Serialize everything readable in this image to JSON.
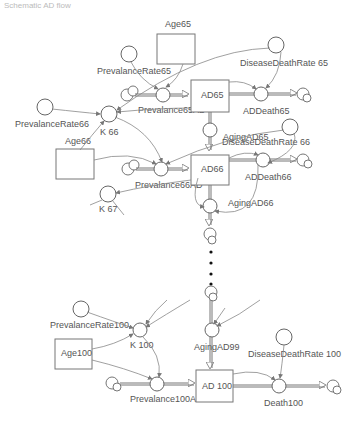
{
  "caption": "Schematic AD flow",
  "stocks": {
    "age65": "Age65",
    "age66": "Age66",
    "age100": "Age100",
    "ad65": "AD65",
    "ad66": "AD66",
    "ad100": "AD 100"
  },
  "converters": {
    "prev_rate65": "PrevalanceRate65",
    "prev_rate66": "PrevalanceRate66",
    "prev_rate100": "PrevalanceRate100",
    "ddr65": "DiseaseDeathRate 65",
    "ddr66": "DiseaseDeathRate 66",
    "ddr100": "DiseaseDeathRate 100",
    "k66": "K 66",
    "k67": "K 67",
    "k100": "K 100"
  },
  "flows": {
    "prev65": "Prevalance65AD",
    "prev66": "Prevalance66AD",
    "prev100": "Prevalance100AD",
    "addeath65": "ADDeath65",
    "addeath66": "ADDeath66",
    "death100": "Death100",
    "aging65": "AgingAD65",
    "aging66": "AgingAD66",
    "aging99": "AgingAD99"
  },
  "ellipsis": "..."
}
